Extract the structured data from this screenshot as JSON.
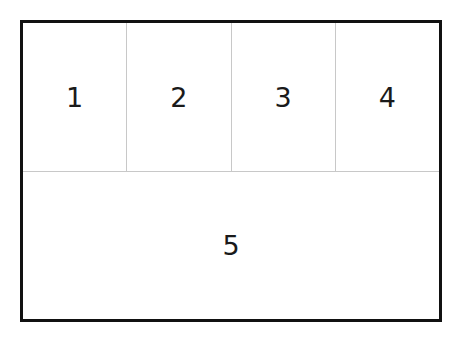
{
  "diagram": {
    "title": "",
    "top_row": [
      {
        "id": 1,
        "label": "1"
      },
      {
        "id": 2,
        "label": "2"
      },
      {
        "id": 3,
        "label": "3"
      },
      {
        "id": 4,
        "label": "4"
      }
    ],
    "bottom_row": [
      {
        "id": 5,
        "label": "5"
      }
    ],
    "colors": {
      "frame": "#111111",
      "divider": "#c8c8c8",
      "text": "#1a1a1a",
      "background": "#ffffff"
    }
  }
}
